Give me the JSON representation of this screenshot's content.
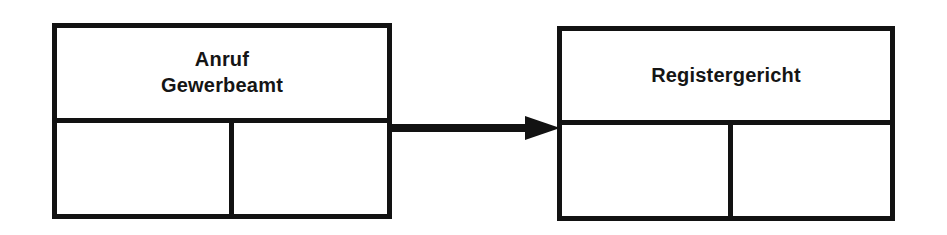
{
  "diagram": {
    "background_color": "#ffffff",
    "stroke_color": "#121212",
    "text_color": "#151515",
    "nodes": [
      {
        "id": "anruf-gewerbeamt",
        "title": "Anruf\nGewerbeamt",
        "title_line_1": "Anruf",
        "title_line_2": "Gewerbeamt",
        "title_align": "center",
        "x": 52,
        "y": 23,
        "width": 340,
        "height": 196,
        "title_cell_height": 95,
        "bottom_divider_x": 172
      },
      {
        "id": "registergericht",
        "title": "Registergericht",
        "title_line_1": "Registergericht",
        "title_line_2": "",
        "title_align": "center",
        "x": 557,
        "y": 26,
        "width": 338,
        "height": 195,
        "title_cell_height": 94,
        "bottom_divider_x": 166
      }
    ],
    "connectors": [
      {
        "id": "anruf-to-registergericht",
        "kind": "arrow-right",
        "from_node": "anruf-gewerbeamt",
        "to_node": "registergericht",
        "x": 390,
        "y": 116,
        "shaft_length": 135,
        "shaft_thickness": 8,
        "head_length": 35,
        "head_half_height": 12,
        "label": ""
      }
    ]
  }
}
